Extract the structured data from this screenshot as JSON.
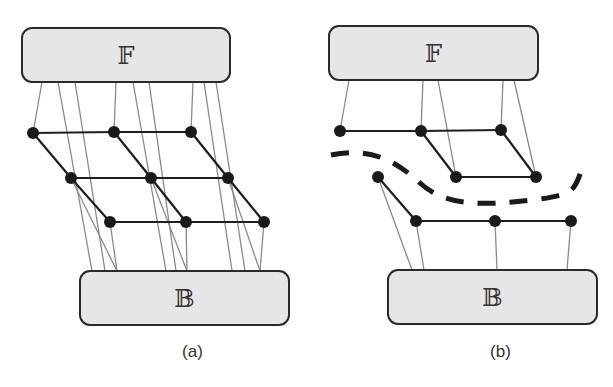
{
  "figure": {
    "panels": [
      {
        "caption": "(a)",
        "top_box_label": "𝔽",
        "bottom_box_label": "𝔹",
        "top_box": {
          "x": 22,
          "y": 28,
          "w": 208,
          "h": 54
        },
        "bottom_box": {
          "x": 80,
          "y": 271,
          "w": 209,
          "h": 54
        },
        "nodes": [
          [
            33,
            133
          ],
          [
            114,
            132
          ],
          [
            191,
            132
          ],
          [
            71,
            178
          ],
          [
            151,
            178
          ],
          [
            228,
            178
          ],
          [
            110,
            222
          ],
          [
            186,
            222
          ],
          [
            264,
            222
          ]
        ],
        "edges": [
          [
            0,
            1
          ],
          [
            1,
            2
          ],
          [
            3,
            4
          ],
          [
            4,
            5
          ],
          [
            6,
            7
          ],
          [
            7,
            8
          ],
          [
            0,
            3
          ],
          [
            3,
            6
          ],
          [
            1,
            4
          ],
          [
            4,
            7
          ],
          [
            2,
            5
          ],
          [
            5,
            8
          ]
        ],
        "fibers": [
          [
            42,
            82,
            33,
            133
          ],
          [
            58,
            82,
            92,
            271
          ],
          [
            75,
            82,
            105,
            271
          ],
          [
            116,
            82,
            114,
            132
          ],
          [
            133,
            82,
            166,
            271
          ],
          [
            149,
            82,
            176,
            271
          ],
          [
            193,
            82,
            191,
            132
          ],
          [
            204,
            82,
            232,
            271
          ],
          [
            216,
            82,
            245,
            271
          ],
          [
            71,
            178,
            117,
            271
          ],
          [
            151,
            178,
            187,
            271
          ],
          [
            228,
            178,
            260,
            271
          ],
          [
            110,
            222,
            117,
            271
          ],
          [
            186,
            222,
            187,
            271
          ],
          [
            264,
            222,
            260,
            271
          ]
        ]
      },
      {
        "caption": "(b)",
        "top_box_label": "𝔽",
        "bottom_box_label": "𝔹",
        "top_box": {
          "x": 329,
          "y": 26,
          "w": 209,
          "h": 54
        },
        "bottom_box": {
          "x": 388,
          "y": 270,
          "w": 209,
          "h": 54
        },
        "nodes": [
          [
            340,
            131
          ],
          [
            421,
            131
          ],
          [
            501,
            130
          ],
          [
            456,
            177
          ],
          [
            536,
            177
          ],
          [
            378,
            177
          ],
          [
            416,
            221
          ],
          [
            495,
            221
          ],
          [
            571,
            221
          ]
        ],
        "edges": [
          [
            0,
            1
          ],
          [
            1,
            2
          ],
          [
            1,
            3
          ],
          [
            2,
            4
          ],
          [
            3,
            4
          ],
          [
            5,
            6
          ],
          [
            6,
            7
          ],
          [
            7,
            8
          ]
        ],
        "fibers": [
          [
            349,
            80,
            340,
            131
          ],
          [
            423,
            80,
            421,
            131
          ],
          [
            438,
            80,
            456,
            177
          ],
          [
            503,
            80,
            501,
            130
          ],
          [
            514,
            80,
            536,
            177
          ],
          [
            378,
            177,
            412,
            270
          ],
          [
            416,
            221,
            424,
            270
          ],
          [
            495,
            221,
            497,
            270
          ],
          [
            571,
            221,
            567,
            270
          ]
        ],
        "cut_path": "M 331 155 C 370 147, 395 160, 420 183 S 480 206, 532 200 S 572 186, 585 164"
      }
    ]
  }
}
